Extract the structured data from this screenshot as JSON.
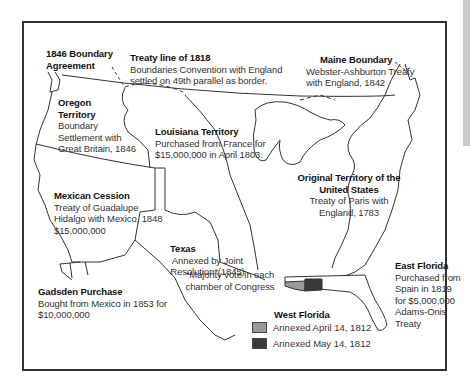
{
  "map": {
    "regions": [
      {
        "id": "boundary-1846",
        "title": "1846 Boundary Agreement",
        "lines": []
      },
      {
        "id": "treaty-1818",
        "title": "Treaty line of 1818",
        "lines": [
          "Boundaries Convention with England",
          "settled on 49th parallel as border."
        ]
      },
      {
        "id": "maine",
        "title": "Maine Boundary",
        "lines": [
          "Webster-Ashburton Treaty",
          "with England, 1842"
        ]
      },
      {
        "id": "oregon",
        "title": "Oregon Territory",
        "lines": [
          "Boundary",
          "Settlement with",
          "Great Britain, 1846"
        ]
      },
      {
        "id": "louisiana",
        "title": "Louisiana Territory",
        "lines": [
          "Purchased from France for",
          "$15,000,000 in April 1803."
        ]
      },
      {
        "id": "original",
        "title": "Original Territory of the United States",
        "lines": [
          "Treaty of Paris with",
          "England, 1783"
        ]
      },
      {
        "id": "mexican-cession",
        "title": "Mexican Cession",
        "lines": [
          "Treaty of Guadalupe",
          "Hidalgo with Mexico, 1848",
          "$15,000,000"
        ]
      },
      {
        "id": "texas",
        "title": "Texas",
        "lines": [
          "Annexed by Joint",
          "Resolution*(1845)",
          "*Majority vote in each",
          "chamber of Congress"
        ]
      },
      {
        "id": "gadsden",
        "title": "Gadsden Purchase",
        "lines": [
          "Bought from Mexico in 1853 for",
          "$10,000,000"
        ]
      },
      {
        "id": "east-florida",
        "title": "East Florida",
        "lines": [
          "Purchased from",
          "Spain in 1819",
          "for $5,000,000",
          "Adams-Onis",
          "Treaty"
        ]
      }
    ],
    "legend": {
      "title": "West Florida",
      "items": [
        {
          "label": "Annexed April 14, 1812",
          "color": "#9a9a9a"
        },
        {
          "label": "Annexed May 14, 1812",
          "color": "#3a3a3a"
        }
      ]
    }
  }
}
